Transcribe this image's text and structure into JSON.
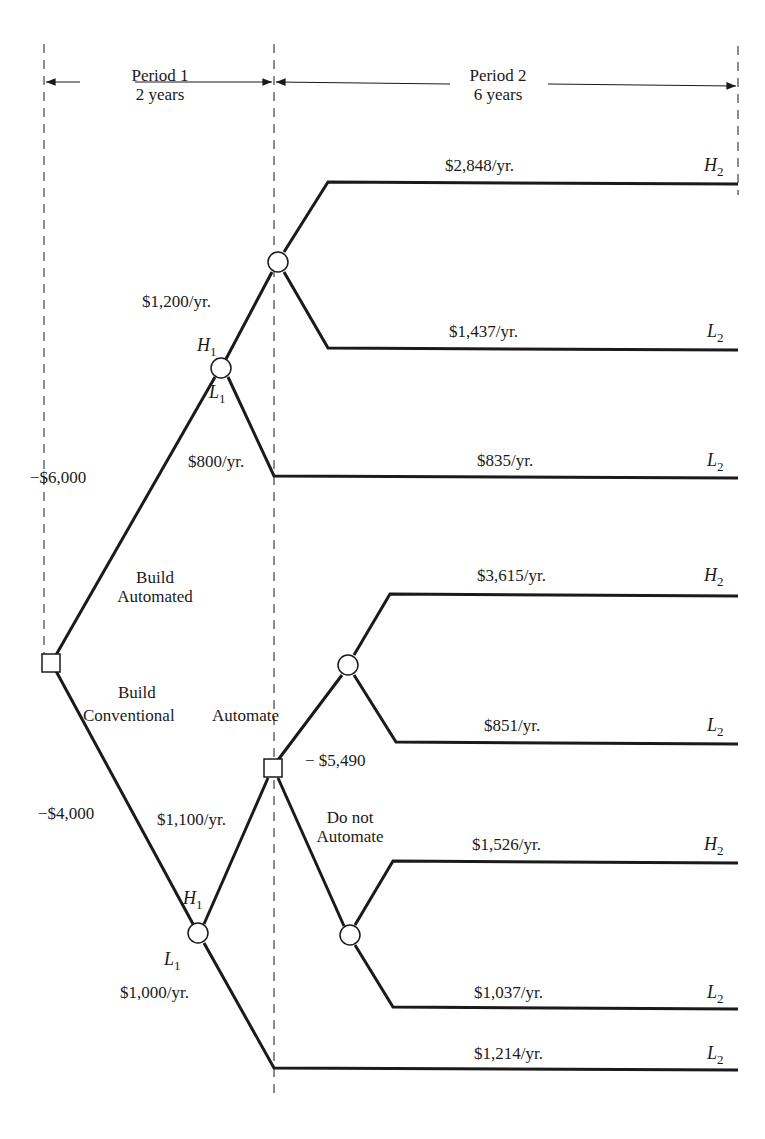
{
  "periods": [
    {
      "title": "Period 1",
      "duration": "2 years"
    },
    {
      "title": "Period 2",
      "duration": "6 years"
    }
  ],
  "decisions": {
    "root_up": {
      "line1": "Build",
      "line2": "Automated",
      "cost": "−$6,000"
    },
    "root_down": {
      "line1": "Build",
      "line2": "Conventional",
      "cost": "−$4,000"
    },
    "second_up": {
      "label": "Automate",
      "cost": "− $5,490"
    },
    "second_down": {
      "line1": "Do not",
      "line2": "Automate"
    }
  },
  "period1_outcomes": {
    "automated_high": "$1,200/yr.",
    "automated_low": "$800/yr.",
    "conventional_high": "$1,100/yr.",
    "conventional_low": "$1,000/yr."
  },
  "state_labels": {
    "H": "H",
    "L": "L",
    "sub1": "1",
    "sub2": "2"
  },
  "period2_outcomes": [
    {
      "value": "$2,848/yr.",
      "state": "H",
      "sub": "2"
    },
    {
      "value": "$1,437/yr.",
      "state": "L",
      "sub": "2"
    },
    {
      "value": "$835/yr.",
      "state": "L",
      "sub": "2"
    },
    {
      "value": "$3,615/yr.",
      "state": "H",
      "sub": "2"
    },
    {
      "value": "$851/yr.",
      "state": "L",
      "sub": "2"
    },
    {
      "value": "$1,526/yr.",
      "state": "H",
      "sub": "2"
    },
    {
      "value": "$1,037/yr.",
      "state": "L",
      "sub": "2"
    },
    {
      "value": "$1,214/yr.",
      "state": "L",
      "sub": "2"
    }
  ],
  "colors": {
    "ink": "#1a1a1a",
    "background": "#ffffff"
  }
}
